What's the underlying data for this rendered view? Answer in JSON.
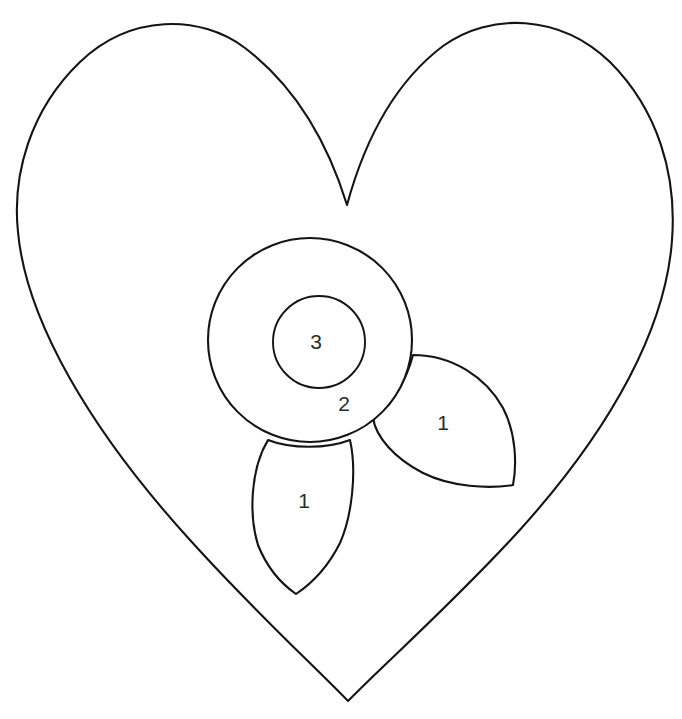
{
  "document": {
    "title": "Heart Flower Applique Pattern",
    "background_color": "#ffffff",
    "line_color": "#141414",
    "fill_color": "#ffffff",
    "width": 682,
    "height": 719
  },
  "shapes": {
    "heart": {
      "name": "heart-outline",
      "label": "",
      "top_left_lobe_peak": [
        178,
        31
      ],
      "top_right_lobe_peak": [
        512,
        31
      ],
      "cleft": [
        347,
        205
      ],
      "left_extreme": [
        18,
        228
      ],
      "right_extreme": [
        672,
        240
      ],
      "bottom_point": [
        348,
        701
      ]
    },
    "flower_outer_circle": {
      "name": "flower-outer-circle",
      "label": "2",
      "center": [
        310,
        340
      ],
      "radius": 102,
      "label_position": [
        344,
        405
      ]
    },
    "flower_inner_circle": {
      "name": "flower-inner-circle",
      "label": "3",
      "center": [
        319,
        342
      ],
      "radius": 46,
      "label_position": [
        316,
        343
      ]
    },
    "petal_bottom": {
      "name": "petal-bottom",
      "label": "1",
      "tip": [
        296,
        594
      ],
      "top_left": [
        268,
        440
      ],
      "top_right": [
        350,
        440
      ],
      "label_position": [
        304,
        502
      ]
    },
    "petal_right": {
      "name": "petal-right",
      "label": "1",
      "tip": [
        373,
        418
      ],
      "corner_top": [
        413,
        355
      ],
      "corner_bottom": [
        513,
        485
      ],
      "label_position": [
        443,
        424
      ]
    }
  },
  "labels": [
    {
      "text": "1",
      "x": 304,
      "y": 502,
      "piece": "petal-bottom"
    },
    {
      "text": "1",
      "x": 443,
      "y": 424,
      "piece": "petal-right"
    },
    {
      "text": "2",
      "x": 344,
      "y": 405,
      "piece": "flower-outer-circle"
    },
    {
      "text": "3",
      "x": 316,
      "y": 343,
      "piece": "flower-inner-circle"
    }
  ]
}
